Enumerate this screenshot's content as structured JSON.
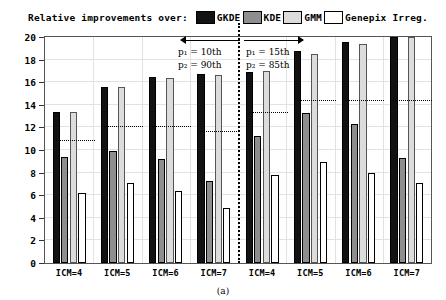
{
  "legend": {
    "title": "Relative improvements over:",
    "items": [
      {
        "label": "GKDE",
        "color": "#121212"
      },
      {
        "label": "KDE",
        "color": "#8e8e8e"
      },
      {
        "label": "GMM",
        "color": "#dcdcdc"
      },
      {
        "label": "Genepix Irreg.",
        "color": "#ffffff"
      }
    ]
  },
  "annotations": {
    "left_p1": "p₁ = 10th",
    "left_p2": "p₂ = 90th",
    "right_p1": "p₁ = 15th",
    "right_p2": "p₂ = 85th"
  },
  "caption": "(a)",
  "chart_data": {
    "type": "bar",
    "title": "Relative improvements over:",
    "xlabel": "",
    "ylabel": "",
    "ylim": [
      0,
      20
    ],
    "yticks": [
      0,
      2,
      4,
      6,
      8,
      10,
      12,
      14,
      16,
      18,
      20
    ],
    "grid": true,
    "legend_position": "top",
    "categories": [
      "ICM=4",
      "ICM=5",
      "ICM=6",
      "ICM=7",
      "ICM=4",
      "ICM=5",
      "ICM=6",
      "ICM=7"
    ],
    "panels": [
      {
        "name": "p1 = 10th / p2 = 90th",
        "categories": [
          "ICM=4",
          "ICM=5",
          "ICM=6",
          "ICM=7"
        ]
      },
      {
        "name": "p1 = 15th / p2 = 85th",
        "categories": [
          "ICM=4",
          "ICM=5",
          "ICM=6",
          "ICM=7"
        ]
      }
    ],
    "series": [
      {
        "name": "GKDE",
        "values": [
          13.4,
          15.6,
          16.5,
          16.7,
          16.9,
          18.8,
          19.6,
          20.0
        ]
      },
      {
        "name": "KDE",
        "values": [
          9.4,
          9.9,
          9.2,
          7.3,
          11.2,
          13.3,
          12.3,
          9.3
        ]
      },
      {
        "name": "GMM",
        "values": [
          13.4,
          15.6,
          16.4,
          16.6,
          17.0,
          18.5,
          19.4,
          20.0
        ]
      },
      {
        "name": "Genepix Irreg.",
        "values": [
          6.2,
          7.1,
          6.4,
          4.9,
          7.8,
          8.9,
          8.0,
          7.1
        ]
      }
    ],
    "reference_lines": [
      10.8,
      12.0,
      12.0,
      11.6,
      13.3,
      14.3,
      14.3,
      14.3
    ],
    "divider_after_group": 4
  }
}
